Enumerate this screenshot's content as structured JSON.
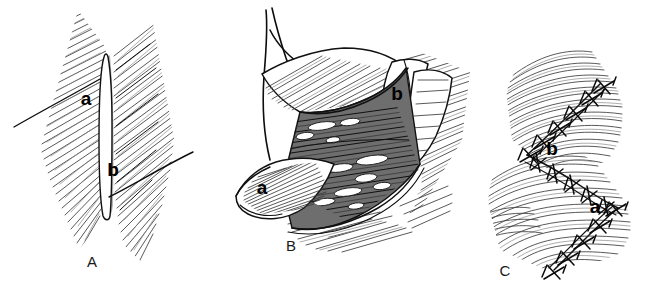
{
  "figure": {
    "background_color": "#ffffff",
    "ink_color": "#111111",
    "style": "pen-and-ink medical line drawing with hatched shading"
  },
  "panels": [
    {
      "id": "A",
      "letter": "A",
      "caption_position": {
        "x": 92,
        "y": 267
      },
      "description": "Vertical elliptical incision outlined on hatched skin surface with relaxed skin tension lines crossing it",
      "callouts": [
        {
          "label": "a",
          "x": 86,
          "y": 105,
          "meaning": "upper skin tension line / proximal incision limb"
        },
        {
          "label": "b",
          "x": 113,
          "y": 176,
          "meaning": "lower skin tension line / distal incision limb"
        }
      ]
    },
    {
      "id": "B",
      "letter": "B",
      "caption_position": {
        "x": 291,
        "y": 251
      },
      "description": "Flap elevated and retracted by traction sutures exposing subcutaneous fat and deep fascia",
      "callouts": [
        {
          "label": "a",
          "x": 262,
          "y": 194,
          "meaning": "pointed leading tip of the raised flap"
        },
        {
          "label": "b",
          "x": 397,
          "y": 100,
          "meaning": "folded back corner of the flap margin"
        }
      ]
    },
    {
      "id": "C",
      "letter": "C",
      "caption_position": {
        "x": 505,
        "y": 276
      },
      "description": "Completed Z-shaped closure with interrupted sutures along both transposed limbs",
      "callouts": [
        {
          "label": "a",
          "x": 595,
          "y": 213,
          "meaning": "transposed lower limb of the Z closure"
        },
        {
          "label": "b",
          "x": 552,
          "y": 155,
          "meaning": "transposed upper limb of the Z closure"
        }
      ]
    }
  ],
  "colors": {
    "paper": "#ffffff",
    "ink": "#111111",
    "hatch_mid": "#3b3b3b",
    "hatch_light": "#8a8a8a",
    "tissue_shadow": "#6e6e6e",
    "incision_shade": "#a8a8a8"
  }
}
